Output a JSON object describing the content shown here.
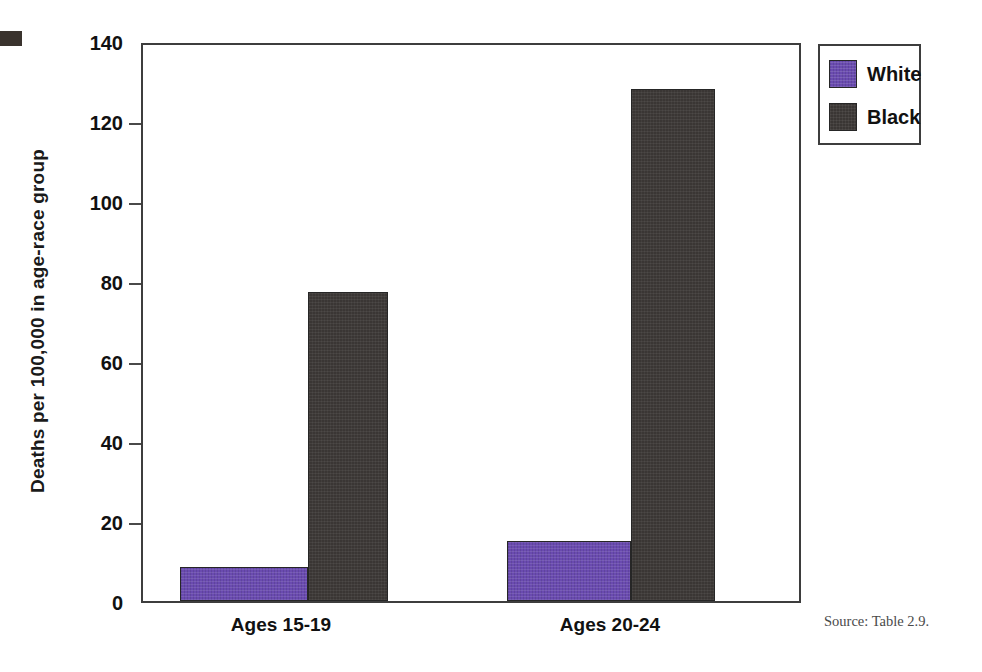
{
  "chart_data": {
    "type": "bar",
    "title": "",
    "xlabel": "",
    "ylabel": "Deaths per 100,000 in age-race group",
    "categories": [
      "Ages 15-19",
      "Ages 20-24"
    ],
    "series": [
      {
        "name": "White",
        "color": "#6a4bb0",
        "values": [
          8.6,
          14.9
        ]
      },
      {
        "name": "Black",
        "color": "#3a3634",
        "values": [
          77.3,
          128.0
        ]
      }
    ],
    "ylim": [
      0,
      140
    ],
    "y_ticks": [
      0,
      20,
      40,
      60,
      80,
      100,
      120,
      140
    ],
    "y_tick_labels": [
      "0",
      "20",
      "40",
      "60",
      "80",
      "100",
      "120",
      "140"
    ],
    "grid": false,
    "legend_position": "top-right",
    "legend_entries": [
      "White",
      "Black"
    ]
  },
  "axis": {
    "y_title": "Deaths per 100,000 in age-race group"
  },
  "legend": {
    "items": [
      {
        "label": "White"
      },
      {
        "label": "Black"
      }
    ]
  },
  "footer": {
    "source": "Source: Table 2.9."
  }
}
